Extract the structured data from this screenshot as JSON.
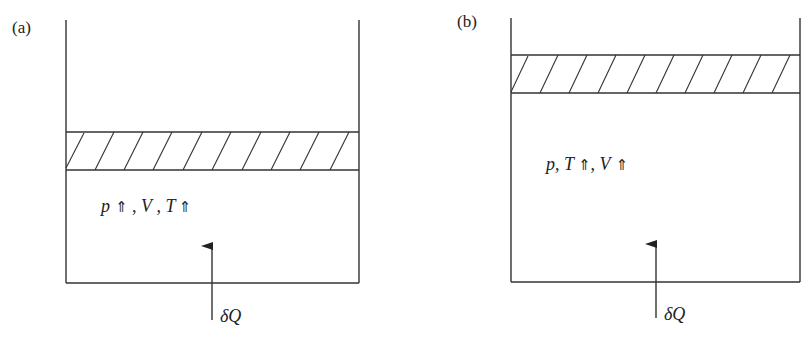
{
  "figure": {
    "panels": [
      {
        "id": "a",
        "label": "(a)",
        "state_text": {
          "p": "p",
          "p_arrow": "⇑",
          "sep1": " , ",
          "V": "V",
          "sep2": " , ",
          "T": "T",
          "T_arrow": "⇑"
        },
        "heat_label": "δQ",
        "description": "Piston fixed (constant volume): heating raises pressure and temperature"
      },
      {
        "id": "b",
        "label": "(b)",
        "state_text": {
          "p": "p",
          "sep1": ", ",
          "T": "T",
          "T_arrow": "⇑",
          "sep2": ", ",
          "V": "V",
          "V_arrow": "⇑"
        },
        "heat_label": "δQ",
        "description": "Piston free (constant pressure): heating raises temperature and volume"
      }
    ],
    "colors": {
      "stroke": "#333333",
      "background": "#ffffff",
      "text": "#222222"
    }
  }
}
